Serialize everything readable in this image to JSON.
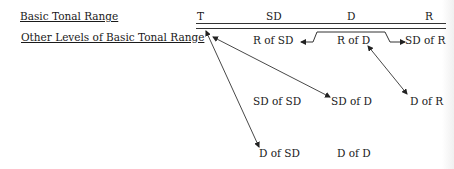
{
  "headings": {
    "basic": "Basic Tonal Range",
    "other": "Other Levels of Basic Tonal Range"
  },
  "basic_range": [
    "T",
    "SD",
    "D",
    "R"
  ],
  "level2": {
    "r_of_sd": "R of SD",
    "r_of_d": "R of D",
    "sd_of_r": "SD of R"
  },
  "level3": {
    "sd_of_sd": "SD of SD",
    "sd_of_d": "SD of D",
    "d_of_r": "D of R"
  },
  "level4": {
    "d_of_sd": "D of SD",
    "d_of_d": "D of D"
  },
  "colors": {
    "ink": "#1a1a1a",
    "line": "#333333"
  }
}
